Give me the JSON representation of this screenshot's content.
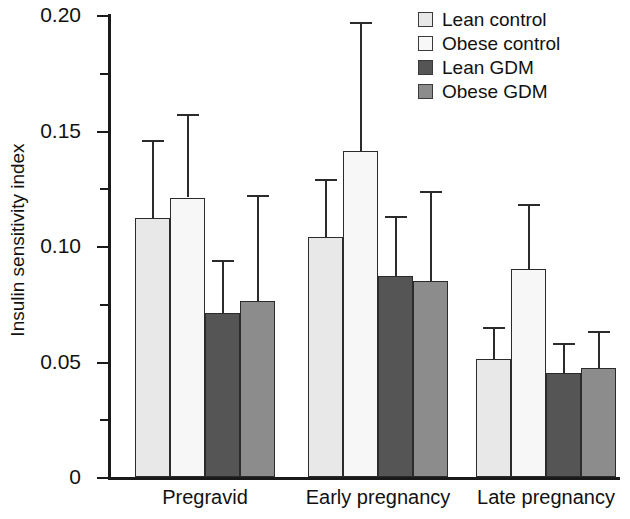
{
  "chart_data": {
    "type": "bar",
    "title": "",
    "xlabel": "",
    "ylabel": "Insulin sensitivity index",
    "ylim": [
      0,
      0.2
    ],
    "ytick_labels": [
      "0",
      "0.05",
      "0.10",
      "0.15",
      "0.20"
    ],
    "ytick_values": [
      0,
      0.05,
      0.1,
      0.15,
      0.2
    ],
    "yminor_ticks": [
      0.025,
      0.075,
      0.125,
      0.175
    ],
    "grid": false,
    "legend_position": "top-right",
    "categories": [
      "Pregravid",
      "Early pregnancy",
      "Late pregnancy"
    ],
    "error_bars": "upper-only",
    "series": [
      {
        "name": "Lean control",
        "color": "#e8e8e8",
        "values": [
          0.112,
          0.104,
          0.051
        ],
        "errors_upper": [
          0.146,
          0.129,
          0.065
        ]
      },
      {
        "name": "Obese control",
        "color": "#f7f7f7",
        "values": [
          0.121,
          0.141,
          0.09
        ],
        "errors_upper": [
          0.157,
          0.197,
          0.118
        ]
      },
      {
        "name": "Lean GDM",
        "color": "#555555",
        "values": [
          0.071,
          0.087,
          0.045
        ],
        "errors_upper": [
          0.094,
          0.113,
          0.058
        ]
      },
      {
        "name": "Obese GDM",
        "color": "#8c8c8c",
        "values": [
          0.076,
          0.085,
          0.047
        ],
        "errors_upper": [
          0.122,
          0.124,
          0.063
        ]
      }
    ]
  },
  "legend": {
    "items": [
      {
        "label": "Lean control",
        "color": "#e8e8e8"
      },
      {
        "label": "Obese control",
        "color": "#f7f7f7"
      },
      {
        "label": "Lean GDM",
        "color": "#555555"
      },
      {
        "label": "Obese GDM",
        "color": "#8c8c8c"
      }
    ]
  }
}
